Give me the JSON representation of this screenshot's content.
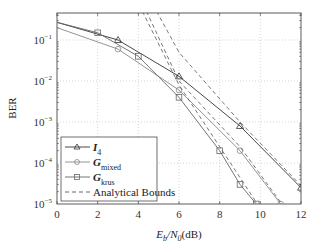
{
  "chart_data": {
    "type": "line",
    "title": "",
    "xlabel": "E_b/N_0(dB)",
    "ylabel": "BER",
    "xlim": [
      0,
      12
    ],
    "ylim": [
      1e-05,
      0.5
    ],
    "yscale": "log",
    "grid": true,
    "legend_position": "lower-left",
    "x_ticks": [
      "0",
      "2",
      "4",
      "6",
      "8",
      "10",
      "12"
    ],
    "y_ticks": [
      "10^-1",
      "10^-2",
      "10^-3",
      "10^-4",
      "10^-5"
    ],
    "series": [
      {
        "name": "I_4",
        "marker": "triangle",
        "style": "solid",
        "color": "#333333",
        "x": [
          0,
          3,
          6,
          9,
          12
        ],
        "y": [
          0.27,
          0.1,
          0.013,
          0.0008,
          2.5e-05
        ]
      },
      {
        "name": "G_mixed",
        "marker": "circle",
        "style": "solid",
        "color": "#888888",
        "x": [
          0,
          3,
          6,
          9,
          11
        ],
        "y": [
          0.2,
          0.06,
          0.006,
          0.0002,
          1e-05
        ]
      },
      {
        "name": "G_krus",
        "marker": "square",
        "style": "solid",
        "color": "#666666",
        "x": [
          0,
          2,
          4,
          6,
          8,
          9,
          9.8
        ],
        "y": [
          0.27,
          0.15,
          0.04,
          0.004,
          0.0002,
          3e-05,
          1e-05
        ]
      },
      {
        "name": "Analytical Bounds",
        "marker": "none",
        "style": "dashed",
        "color": "#555555",
        "curves": [
          {
            "for": "I_4",
            "x": [
              4.9,
              6,
              9,
              12
            ],
            "y": [
              0.5,
              0.05,
              0.001,
              2.8e-05
            ]
          },
          {
            "for": "G_mixed",
            "x": [
              4.4,
              6,
              9,
              11
            ],
            "y": [
              0.5,
              0.01,
              0.00025,
              1.1e-05
            ]
          },
          {
            "for": "G_krus",
            "x": [
              4.2,
              6,
              8,
              9.8
            ],
            "y": [
              0.5,
              0.008,
              0.00025,
              1.1e-05
            ]
          }
        ]
      }
    ]
  },
  "legend": {
    "items": [
      {
        "label": "I",
        "sub": "4"
      },
      {
        "label": "G",
        "sub": "mixed"
      },
      {
        "label": "G",
        "sub": "krus"
      },
      {
        "label": "Analytical Bounds",
        "sub": ""
      }
    ]
  },
  "axes": {
    "xlabel_main": "E",
    "xlabel_sub1": "b",
    "xlabel_mid": "/N",
    "xlabel_sub2": "0",
    "xlabel_end": "(dB)",
    "ylabel": "BER"
  }
}
